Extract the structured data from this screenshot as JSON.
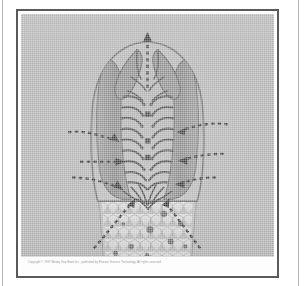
{
  "figure": {
    "kind": "halftone-scanned-plate",
    "caption": "Copyright © 1997 Mosby-Year Book Inc., published by Elsevier Science Technology. All rights reserved.",
    "plate_background": "#b0b0b0",
    "frame_color": "#5a5a5a",
    "mat_color": "#ffffff",
    "ink_color": "#4a4a4a"
  },
  "specimen": {
    "title": "Bilaterally symmetric specimen, dorsal view",
    "outline_color": "#6f6f6f",
    "body_fill": "#a6a6a6",
    "lateral_plate_fill": "#8b8b8b",
    "honeycomb_fill": "#d8d8d8",
    "honeycomb_cell_count": 96,
    "dark_spot_count": 9,
    "segment_pairs": 11
  },
  "annotations": {
    "arrow_color": "#3d3d3d",
    "style": "dashed",
    "items": [
      {
        "name": "apical-arrow",
        "direction": "up",
        "side": "center"
      },
      {
        "name": "left-upper-arrow",
        "direction": "right-inward",
        "side": "left"
      },
      {
        "name": "left-mid-arrow",
        "direction": "right-inward",
        "side": "left"
      },
      {
        "name": "left-lower-arrow",
        "direction": "right-inward",
        "side": "left"
      },
      {
        "name": "right-upper-arrow",
        "direction": "left-inward",
        "side": "right"
      },
      {
        "name": "right-mid-arrow",
        "direction": "left-inward",
        "side": "right"
      },
      {
        "name": "right-lower-arrow",
        "direction": "left-inward",
        "side": "right"
      },
      {
        "name": "basal-left-arrow",
        "direction": "up-right",
        "side": "left"
      },
      {
        "name": "basal-right-arrow",
        "direction": "up-left",
        "side": "right"
      }
    ]
  }
}
